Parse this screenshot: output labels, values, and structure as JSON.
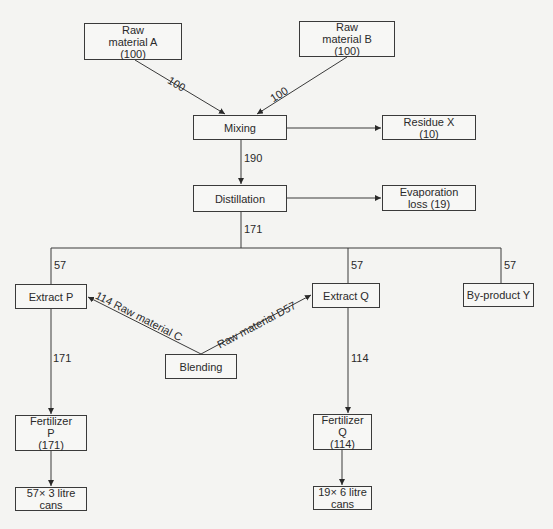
{
  "nodes": {
    "raw_a": {
      "lines": [
        "Raw",
        "material A",
        "(100)"
      ]
    },
    "raw_b": {
      "lines": [
        "Raw",
        "material B",
        "(100)"
      ]
    },
    "mixing": {
      "lines": [
        "Mixing"
      ]
    },
    "residue_x": {
      "lines": [
        "Residue X",
        "(10)"
      ]
    },
    "distillation": {
      "lines": [
        "Distillation"
      ]
    },
    "evaporation": {
      "lines": [
        "Evaporation",
        "loss (19)"
      ]
    },
    "extract_p": {
      "lines": [
        "Extract P"
      ]
    },
    "extract_q": {
      "lines": [
        "Extract Q"
      ]
    },
    "byproduct_y": {
      "lines": [
        "By-product Y"
      ]
    },
    "blending": {
      "lines": [
        "Blending"
      ]
    },
    "fertilizer_p": {
      "lines": [
        "Fertilizer",
        "P",
        "(171)"
      ]
    },
    "fertilizer_q": {
      "lines": [
        "Fertilizer",
        "Q",
        "(114)"
      ]
    },
    "cans_p": {
      "lines": [
        "57× 3 litre",
        "cans"
      ]
    },
    "cans_q": {
      "lines": [
        "19× 6 litre",
        "cans"
      ]
    }
  },
  "edges": {
    "a_to_mixing": "100",
    "b_to_mixing": "100",
    "mixing_to_distillation": "190",
    "distillation_out": "171",
    "to_extract_p": "57",
    "to_extract_q": "57",
    "to_byproduct_y": "57",
    "blending_to_p": "114 Raw material C",
    "blending_to_q": "Raw material D57",
    "extract_p_to_fertilizer": "171",
    "extract_q_to_fertilizer": "114"
  },
  "colors": {
    "line": "#3a3a3a",
    "background": "#f4f4f2"
  }
}
